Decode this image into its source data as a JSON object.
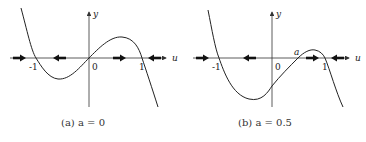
{
  "panels": [
    {
      "id": "a",
      "caption": "(a) a = 0",
      "axis_labels": {
        "x": "u",
        "y": "y"
      },
      "tick_labels": {
        "neg1": "-1",
        "zero": "0",
        "one": "1"
      },
      "a_label": "",
      "function": "y = u - u^3 (roots at -1, 0, 1)",
      "equilibria": [
        -1,
        0,
        1
      ],
      "flow_arrows": [
        {
          "position": "u<-1",
          "direction": "right"
        },
        {
          "position": "-1<u<0",
          "direction": "left"
        },
        {
          "position": "0<u<1",
          "direction": "right"
        },
        {
          "position": "u>1",
          "direction": "left"
        }
      ]
    },
    {
      "id": "b",
      "caption": "(b) a = 0.5",
      "axis_labels": {
        "x": "u",
        "y": "y"
      },
      "tick_labels": {
        "neg1": "-1",
        "zero": "0",
        "one": "1"
      },
      "a_label": "a",
      "function": "y = -(u+1)(u-a)(u-1), a = 0.5",
      "equilibria": [
        -1,
        0.5,
        1
      ],
      "flow_arrows": [
        {
          "position": "u<-1",
          "direction": "right"
        },
        {
          "position": "-1<u<a",
          "direction": "left"
        },
        {
          "position": "a<u<1",
          "direction": "right"
        },
        {
          "position": "u>1",
          "direction": "left"
        }
      ]
    }
  ],
  "colors": {
    "curve": "#222222",
    "axis": "#333333",
    "arrow": "#111111"
  }
}
